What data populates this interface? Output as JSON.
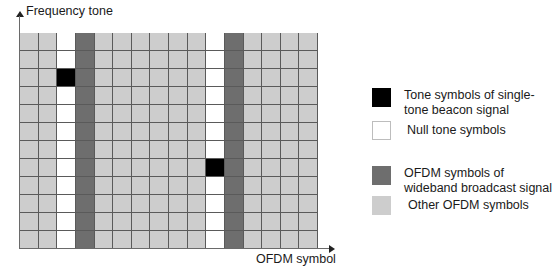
{
  "axes": {
    "y_label": "Frequency tone",
    "x_label": "OFDM symbol"
  },
  "colors": {
    "beacon": "#000000",
    "null": "#ffffff",
    "ofdm_wideband": "#6e6e6e",
    "other_ofdm": "#cdcdcd",
    "grid_line": "#5a5a5a"
  },
  "grid": {
    "columns": 16,
    "rows": 12,
    "null_columns": [
      2,
      10
    ],
    "wideband_columns": [
      3,
      11
    ],
    "beacon_cells": [
      {
        "row": 2,
        "col": 2
      },
      {
        "row": 7,
        "col": 10
      }
    ]
  },
  "legend": {
    "items": [
      {
        "key": "beacon",
        "label": "Tone symbols of single-tone beacon signal"
      },
      {
        "key": "null",
        "label": "Null tone symbols"
      },
      {
        "key": "ofdm_wideband",
        "label": "OFDM symbols of wideband broadcast signal"
      },
      {
        "key": "other_ofdm",
        "label": "Other OFDM symbols"
      }
    ]
  }
}
